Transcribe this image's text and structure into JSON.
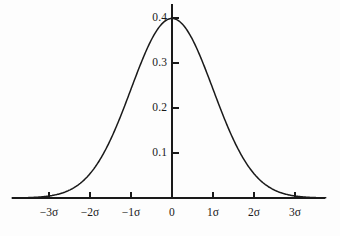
{
  "chart_data": {
    "type": "line",
    "title": "",
    "subtitle": "",
    "xlabel": "",
    "ylabel": "",
    "grid": false,
    "legend": null,
    "curve_label": "standard normal probability density",
    "xlim": [
      -3.9,
      3.75
    ],
    "ylim": [
      0,
      0.435
    ],
    "x_ticks": [
      {
        "value": -3,
        "label": "−3σ"
      },
      {
        "value": -2,
        "label": "−2σ"
      },
      {
        "value": -1,
        "label": "−1σ"
      },
      {
        "value": 0,
        "label": "0"
      },
      {
        "value": 1,
        "label": "1σ"
      },
      {
        "value": 2,
        "label": "2σ"
      },
      {
        "value": 3,
        "label": "3σ"
      }
    ],
    "y_ticks": [
      {
        "value": 0.1,
        "label": "0.1"
      },
      {
        "value": 0.2,
        "label": "0.2"
      },
      {
        "value": 0.3,
        "label": "0.3"
      },
      {
        "value": 0.4,
        "label": "0.4"
      }
    ],
    "peak": {
      "x": 0,
      "y": 0.3989
    },
    "x": [
      -3.9,
      -3.7,
      -3.5,
      -3.3,
      -3.1,
      -2.9,
      -2.7,
      -2.5,
      -2.3,
      -2.1,
      -1.9,
      -1.7,
      -1.5,
      -1.3,
      -1.1,
      -0.9,
      -0.7,
      -0.5,
      -0.3,
      -0.1,
      0.1,
      0.3,
      0.5,
      0.7,
      0.9,
      1.1,
      1.3,
      1.5,
      1.7,
      1.9,
      2.1,
      2.3,
      2.5,
      2.7,
      2.9,
      3.1,
      3.3,
      3.5,
      3.7,
      3.75
    ],
    "values": [
      0.0002,
      0.0004,
      0.0009,
      0.0017,
      0.0033,
      0.006,
      0.0104,
      0.0175,
      0.0283,
      0.044,
      0.0656,
      0.094,
      0.1295,
      0.1714,
      0.2179,
      0.2661,
      0.3123,
      0.3521,
      0.3814,
      0.397,
      0.397,
      0.3814,
      0.3521,
      0.3123,
      0.2661,
      0.2179,
      0.1714,
      0.1295,
      0.094,
      0.0656,
      0.044,
      0.0283,
      0.0175,
      0.0104,
      0.006,
      0.0033,
      0.0017,
      0.0009,
      0.0004,
      0.0003
    ],
    "colors": {
      "curve": "#1a1a1a",
      "axis": "#1a1a1a",
      "background": "#fdfdfd",
      "text": "#1a1a1a"
    }
  },
  "geometry": {
    "origin_x": 172,
    "origin_y": 198,
    "x_scale_per_sigma": 41,
    "y_scale_per_tenth": 45,
    "x_axis_start": 12,
    "x_axis_end": 325,
    "y_axis_top": 4
  }
}
